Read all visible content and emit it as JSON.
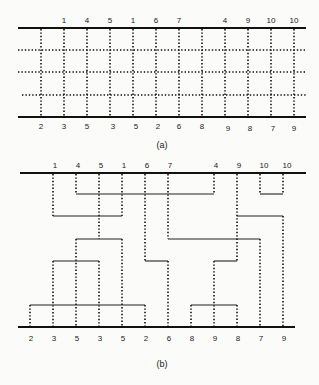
{
  "figure": {
    "panel_a": {
      "caption": "(a)",
      "top_labels": [
        "",
        "1",
        "4",
        "5",
        "1",
        "6",
        "7",
        "",
        "4",
        "9",
        "10",
        "10"
      ],
      "bottom_labels": [
        "2",
        "3",
        "5",
        "3",
        "5",
        "2",
        "6",
        "8",
        "9",
        "8",
        "7",
        "9"
      ],
      "grid_rows": 3
    },
    "panel_b": {
      "caption": "(b)",
      "top_labels": [
        "",
        "1",
        "4",
        "5",
        "1",
        "6",
        "7",
        "",
        "4",
        "9",
        "10",
        "10"
      ],
      "bottom_labels": [
        "2",
        "3",
        "5",
        "3",
        "5",
        "2",
        "6",
        "8",
        "9",
        "8",
        "7",
        "9"
      ]
    }
  }
}
